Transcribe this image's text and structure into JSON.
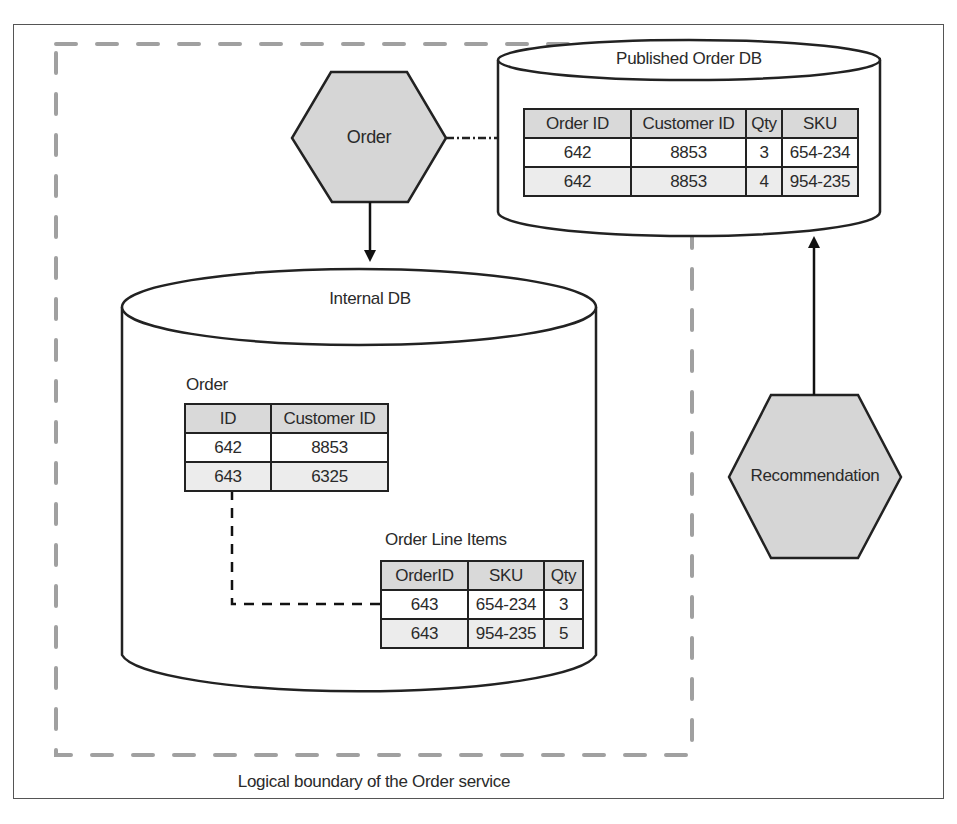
{
  "diagram": {
    "boundary_label": "Logical boundary of the Order service",
    "services": {
      "order": {
        "label": "Order"
      },
      "recommendation": {
        "label": "Recommendation"
      }
    },
    "published_db": {
      "title": "Published Order DB",
      "table": {
        "columns": [
          "Order ID",
          "Customer ID",
          "Qty",
          "SKU"
        ],
        "rows": [
          [
            "642",
            "8853",
            "3",
            "654-234"
          ],
          [
            "642",
            "8853",
            "4",
            "954-235"
          ]
        ]
      }
    },
    "internal_db": {
      "title": "Internal DB",
      "order_table": {
        "title": "Order",
        "columns": [
          "ID",
          "Customer ID"
        ],
        "rows": [
          [
            "642",
            "8853"
          ],
          [
            "643",
            "6325"
          ]
        ]
      },
      "line_items_table": {
        "title": "Order Line Items",
        "columns": [
          "OrderID",
          "SKU",
          "Qty"
        ],
        "rows": [
          [
            "643",
            "654-234",
            "3"
          ],
          [
            "643",
            "954-235",
            "5"
          ]
        ]
      }
    },
    "connections": [
      {
        "from": "order",
        "to": "published_db",
        "style": "dash-dot"
      },
      {
        "from": "order",
        "to": "internal_db",
        "style": "solid-arrow"
      },
      {
        "from": "recommendation",
        "to": "published_db",
        "style": "solid-arrow"
      },
      {
        "from": "line_items_table",
        "to": "order_table",
        "style": "dashed-arrow"
      }
    ],
    "colors": {
      "hexagon_fill": "#d6d6d6",
      "stroke": "#222222",
      "boundary_dash": "#9a9a9a",
      "header_fill": "#d9d9d9"
    }
  }
}
